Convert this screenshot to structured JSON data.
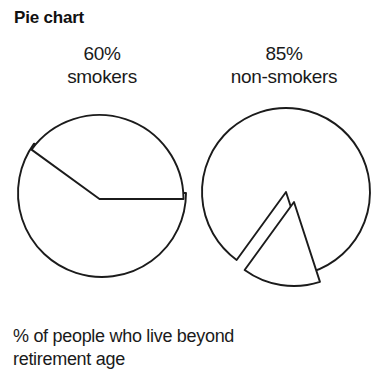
{
  "figure": {
    "title": "Pie chart",
    "caption_line1": "% of people who live beyond",
    "caption_line2": "retirement age"
  },
  "labels": {
    "left_percent": "60%",
    "left_name": "smokers",
    "right_percent": "85%",
    "right_name": "non-smokers"
  },
  "chart_data": {
    "type": "pie",
    "title": "Pie chart",
    "subtitle": "% of people who live beyond retirement age",
    "xlabel": "",
    "ylabel": "",
    "legend_position": "above-each-chart",
    "grid": false,
    "charts": [
      {
        "name": "smokers",
        "label": "60% smokers",
        "center": [
          102,
          193
        ],
        "radius": 84,
        "slices": [
          {
            "label": "60%",
            "value": 60,
            "start_angle_deg": 0,
            "end_angle_deg": 216,
            "exploded": false,
            "fill": "#ffffff",
            "stroke": "#1b1b1b"
          },
          {
            "label": "40%",
            "value": 40,
            "start_angle_deg": 216,
            "end_angle_deg": 360,
            "exploded": true,
            "fill": "#ffffff",
            "stroke": "#1b1b1b"
          }
        ]
      },
      {
        "name": "non-smokers",
        "label": "85% non-smokers",
        "center": [
          286,
          192
        ],
        "radius": 84,
        "slices": [
          {
            "label": "85%",
            "value": 85,
            "start_angle_deg": 126,
            "end_angle_deg": 432,
            "exploded": false,
            "fill": "#ffffff",
            "stroke": "#1b1b1b"
          },
          {
            "label": "15%",
            "value": 15,
            "start_angle_deg": 72,
            "end_angle_deg": 126,
            "exploded": true,
            "fill": "#ffffff",
            "stroke": "#1b1b1b"
          }
        ]
      }
    ],
    "colors": {
      "background": "#ffffff",
      "stroke": "#1b1b1b",
      "text": "#1a1a1a"
    }
  }
}
